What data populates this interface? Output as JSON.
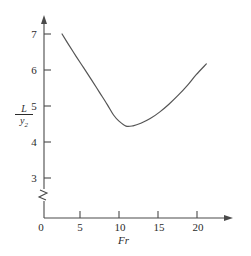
{
  "figure": {
    "background_color": "#ffffff",
    "line_color": "#555555",
    "axis_color": "#4a4a4a",
    "text_color": "#2b2b2b"
  },
  "axes": {
    "x": {
      "label": "Fr",
      "ticks": [
        "0",
        "5",
        "10",
        "15",
        "20"
      ],
      "tick_values": [
        0,
        5,
        10,
        15,
        20
      ],
      "range": [
        0,
        22
      ],
      "arrow": true
    },
    "y": {
      "label_numerator": "L",
      "label_denominator": "y",
      "label_denominator_sub": "2",
      "ticks": [
        "3",
        "4",
        "5",
        "6",
        "7"
      ],
      "tick_values": [
        3,
        4,
        5,
        6,
        7
      ],
      "range": [
        3,
        7.4
      ],
      "arrow": true,
      "axis_break": true
    }
  },
  "chart_data": {
    "type": "line",
    "title": "",
    "xlabel": "Fr",
    "ylabel": "L/y2",
    "xlim": [
      0,
      22
    ],
    "ylim": [
      3,
      7.4
    ],
    "grid": false,
    "legend": null,
    "axis_break_y": {
      "present": true,
      "between": [
        0,
        3
      ]
    },
    "series": [
      {
        "name": "L/y2 vs Fr",
        "x": [
          2.7,
          3.5,
          4.5,
          5.5,
          6.5,
          7.5,
          8.5,
          9.3,
          10.0,
          10.9,
          11.8,
          12.8,
          14.0,
          15.2,
          16.4,
          17.6,
          18.8,
          19.9,
          21.2
        ],
        "y": [
          3.0,
          3.28,
          3.62,
          3.95,
          4.28,
          4.62,
          4.96,
          5.25,
          5.42,
          5.56,
          5.55,
          5.48,
          5.35,
          5.17,
          4.95,
          4.7,
          4.42,
          4.13,
          3.83
        ]
      }
    ]
  },
  "tick_labels": {
    "x": [
      {
        "text": "0",
        "px": 41
      },
      {
        "text": "5",
        "px": 80
      },
      {
        "text": "10",
        "px": 119
      },
      {
        "text": "15",
        "px": 158
      },
      {
        "text": "20",
        "px": 197
      }
    ],
    "y": [
      {
        "text": "7",
        "px": 34
      },
      {
        "text": "6",
        "px": 70
      },
      {
        "text": "5",
        "px": 106
      },
      {
        "text": "4",
        "px": 142
      },
      {
        "text": "3",
        "px": 178
      }
    ]
  }
}
